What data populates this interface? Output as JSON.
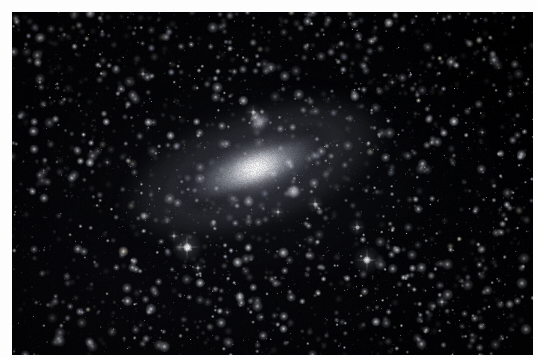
{
  "image": {
    "kind": "astrophotograph",
    "subject": "spiral galaxy with companion galaxies in a dense star field",
    "orientation": "landscape",
    "border_color": "#fdfdfd",
    "sky_color": "#010103",
    "width_px": 537,
    "height_px": 358
  },
  "plate": {
    "left_px": 12,
    "top_px": 12,
    "width_px": 521,
    "height_px": 343
  },
  "objects": [
    {
      "id": "main-galaxy",
      "type": "spiral-galaxy",
      "center_x": 243,
      "center_y": 156,
      "major_axis_px": 300,
      "minor_axis_px": 150,
      "position_angle_deg": -20,
      "core_color": "#ffffff",
      "halo_color": "#d6d8de"
    },
    {
      "id": "companion-elliptical-upper",
      "type": "elliptical-galaxy",
      "center_x": 248,
      "center_y": 110,
      "major_axis_px": 26,
      "minor_axis_px": 18,
      "position_angle_deg": -55,
      "core_color": "#f6f7fa"
    },
    {
      "id": "companion-elliptical-lower",
      "type": "elliptical-galaxy",
      "center_x": 281,
      "center_y": 179,
      "major_axis_px": 13,
      "minor_axis_px": 11,
      "position_angle_deg": 0,
      "core_color": "#ffffff"
    }
  ],
  "bright_stars": [
    {
      "x": 175,
      "y": 235,
      "size": 9,
      "glow": 1.0
    },
    {
      "x": 355,
      "y": 248,
      "size": 8,
      "glow": 0.92
    },
    {
      "x": 345,
      "y": 215,
      "size": 5,
      "glow": 0.7
    },
    {
      "x": 241,
      "y": 100,
      "size": 5,
      "glow": 0.7
    },
    {
      "x": 162,
      "y": 224,
      "size": 4,
      "glow": 0.6
    },
    {
      "x": 186,
      "y": 256,
      "size": 4,
      "glow": 0.58
    },
    {
      "x": 303,
      "y": 192,
      "size": 5,
      "glow": 0.72
    },
    {
      "x": 266,
      "y": 200,
      "size": 4,
      "glow": 0.6
    },
    {
      "x": 131,
      "y": 62,
      "size": 4,
      "glow": 0.55
    },
    {
      "x": 430,
      "y": 290,
      "size": 4,
      "glow": 0.55
    },
    {
      "x": 70,
      "y": 300,
      "size": 3,
      "glow": 0.48
    },
    {
      "x": 470,
      "y": 120,
      "size": 3,
      "glow": 0.48
    },
    {
      "x": 380,
      "y": 70,
      "size": 3,
      "glow": 0.46
    },
    {
      "x": 95,
      "y": 150,
      "size": 3,
      "glow": 0.46
    },
    {
      "x": 215,
      "y": 300,
      "size": 3,
      "glow": 0.44
    }
  ],
  "starfield": {
    "description": "very dense field of faint pinpoint stars across the whole frame",
    "approx_star_count": 2600,
    "star_color": "#e8eaf0",
    "seed": 20240517
  }
}
